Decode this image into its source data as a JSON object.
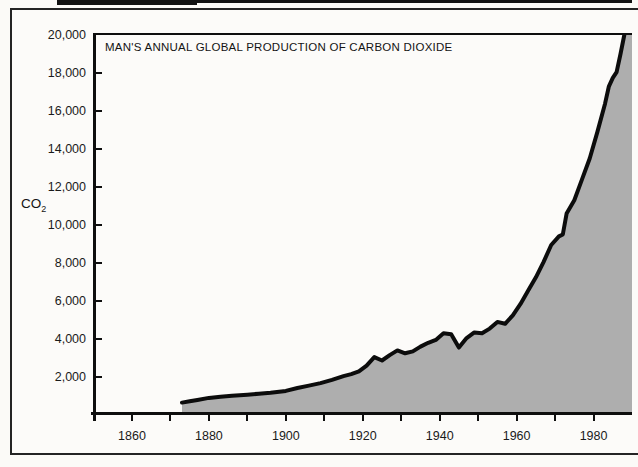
{
  "figure": {
    "title": "MAN'S ANNUAL GLOBAL PRODUCTION OF CARBON DIOXIDE",
    "y_axis_unit": {
      "text": "CO",
      "subscript": "2"
    }
  },
  "chart_data": {
    "type": "area",
    "title": "MAN'S ANNUAL GLOBAL PRODUCTION OF CARBON DIOXIDE",
    "ylabel": "CO2",
    "xlabel": "",
    "xlim": [
      1850,
      1990
    ],
    "ylim": [
      0,
      20000
    ],
    "grid": false,
    "legend": "none",
    "y_ticks": [
      {
        "value": 20000,
        "label": "20,000",
        "tick": false
      },
      {
        "value": 18000,
        "label": "18,000",
        "tick": true
      },
      {
        "value": 16000,
        "label": "16,000",
        "tick": true
      },
      {
        "value": 14000,
        "label": "14,000",
        "tick": true
      },
      {
        "value": 12000,
        "label": "12,000",
        "tick": true
      },
      {
        "value": 10000,
        "label": "10,000",
        "tick": true
      },
      {
        "value": 8000,
        "label": "8,000",
        "tick": true
      },
      {
        "value": 6000,
        "label": "6,000",
        "tick": true
      },
      {
        "value": 4000,
        "label": "4,000",
        "tick": true
      },
      {
        "value": 2000,
        "label": "2,000",
        "tick": true
      }
    ],
    "x_minor_ticks": [
      1860,
      1870,
      1880,
      1890,
      1900,
      1910,
      1920,
      1930,
      1940,
      1950,
      1960,
      1970,
      1980
    ],
    "x_tick_labels": [
      {
        "year": 1860,
        "label": "1860"
      },
      {
        "year": 1880,
        "label": "1880"
      },
      {
        "year": 1900,
        "label": "1900"
      },
      {
        "year": 1920,
        "label": "1920"
      },
      {
        "year": 1940,
        "label": "1940"
      },
      {
        "year": 1960,
        "label": "1960"
      },
      {
        "year": 1980,
        "label": "1980"
      }
    ],
    "series": [
      {
        "name": "Annual global CO2 production",
        "points": [
          [
            1873,
            650
          ],
          [
            1875,
            720
          ],
          [
            1877,
            790
          ],
          [
            1880,
            900
          ],
          [
            1883,
            960
          ],
          [
            1886,
            1010
          ],
          [
            1890,
            1070
          ],
          [
            1893,
            1120
          ],
          [
            1896,
            1170
          ],
          [
            1900,
            1270
          ],
          [
            1903,
            1420
          ],
          [
            1906,
            1550
          ],
          [
            1909,
            1680
          ],
          [
            1912,
            1850
          ],
          [
            1915,
            2050
          ],
          [
            1917,
            2150
          ],
          [
            1919,
            2300
          ],
          [
            1921,
            2600
          ],
          [
            1923,
            3050
          ],
          [
            1925,
            2870
          ],
          [
            1927,
            3150
          ],
          [
            1929,
            3400
          ],
          [
            1931,
            3250
          ],
          [
            1933,
            3350
          ],
          [
            1935,
            3600
          ],
          [
            1937,
            3800
          ],
          [
            1939,
            3950
          ],
          [
            1941,
            4300
          ],
          [
            1943,
            4250
          ],
          [
            1945,
            3550
          ],
          [
            1947,
            4050
          ],
          [
            1949,
            4350
          ],
          [
            1951,
            4300
          ],
          [
            1953,
            4550
          ],
          [
            1955,
            4900
          ],
          [
            1957,
            4800
          ],
          [
            1959,
            5250
          ],
          [
            1961,
            5850
          ],
          [
            1963,
            6550
          ],
          [
            1965,
            7250
          ],
          [
            1967,
            8050
          ],
          [
            1969,
            8950
          ],
          [
            1971,
            9400
          ],
          [
            1972,
            9500
          ],
          [
            1973,
            10600
          ],
          [
            1975,
            11300
          ],
          [
            1977,
            12400
          ],
          [
            1979,
            13500
          ],
          [
            1981,
            14900
          ],
          [
            1983,
            16400
          ],
          [
            1984,
            17300
          ],
          [
            1985,
            17750
          ],
          [
            1986,
            18050
          ],
          [
            1987,
            19000
          ],
          [
            1988,
            20000
          ],
          [
            1989,
            20650
          ],
          [
            1990,
            21300
          ]
        ]
      }
    ],
    "colors": {
      "area_fill": "#aeaeae",
      "line": "#0c0c0c",
      "frame": "#0e0e0e"
    }
  }
}
